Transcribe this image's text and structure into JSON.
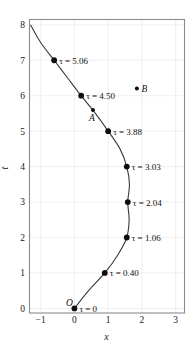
{
  "chart_data": {
    "type": "line",
    "title": "",
    "xlabel": "x",
    "ylabel": "t",
    "xlim": [
      -1.33,
      3.26
    ],
    "ylim": [
      -0.13,
      8.15
    ],
    "xticks": [
      -1,
      0,
      1,
      2,
      3
    ],
    "xticklabels": [
      "−1",
      "0",
      "1",
      "2",
      "3"
    ],
    "yticks": [
      0,
      1,
      2,
      3,
      4,
      5,
      6,
      7,
      8
    ],
    "yticklabels": [
      "0",
      "1",
      "2",
      "3",
      "4",
      "5",
      "6",
      "7",
      "8"
    ],
    "grid": true,
    "legend": "none",
    "series": [
      {
        "name": "trajectory",
        "x": [
          0.0,
          0.42,
          0.9,
          1.28,
          1.55,
          1.62,
          1.58,
          1.63,
          1.55,
          1.35,
          1.0,
          0.62,
          0.2,
          -0.2,
          -0.6,
          -1.0,
          -1.3
        ],
        "t": [
          0.0,
          0.5,
          1.0,
          1.5,
          2.0,
          2.5,
          3.0,
          3.5,
          4.0,
          4.5,
          5.0,
          5.5,
          6.0,
          6.5,
          7.0,
          7.5,
          8.0
        ]
      }
    ],
    "marked_points": [
      {
        "name": "origin",
        "x": 0.0,
        "t": 0,
        "label": "τ = 0",
        "label_dx": 5,
        "label_dy": 3.5
      },
      {
        "name": "tau-0.40",
        "x": 0.9,
        "t": 1,
        "label": "τ = 0.40",
        "label_dx": 5,
        "label_dy": 3.5
      },
      {
        "name": "tau-1.06",
        "x": 1.55,
        "t": 2,
        "label": "τ = 1.06",
        "label_dx": 5,
        "label_dy": 3.5
      },
      {
        "name": "tau-2.04",
        "x": 1.58,
        "t": 3,
        "label": "τ = 2.04",
        "label_dx": 5,
        "label_dy": 3.5
      },
      {
        "name": "tau-3.03",
        "x": 1.55,
        "t": 4,
        "label": "τ = 3.03",
        "label_dx": 5,
        "label_dy": 3.5
      },
      {
        "name": "tau-3.88",
        "x": 1.0,
        "t": 5,
        "label": "τ = 3.88",
        "label_dx": 5,
        "label_dy": 3.5
      },
      {
        "name": "tau-4.50",
        "x": 0.2,
        "t": 6,
        "label": "τ = 4.50",
        "label_dx": 5,
        "label_dy": 3.5
      },
      {
        "name": "tau-5.06",
        "x": -0.6,
        "t": 7,
        "label": "τ = 5.06",
        "label_dx": 5,
        "label_dy": 3.5
      }
    ],
    "annotated_points": [
      {
        "name": "point-a",
        "x": 0.55,
        "t": 5.6,
        "label": "A",
        "label_dx": -4,
        "label_dy": 11,
        "dot_size": 2.0
      },
      {
        "name": "point-b",
        "x": 1.85,
        "t": 6.2,
        "label": "B",
        "label_dx": 4.5,
        "label_dy": 3.5,
        "dot_size": 2.0
      }
    ],
    "origin_marker": {
      "name": "origin-letter",
      "label": "O",
      "x": 0.0,
      "t": 0,
      "label_dx": -8.5,
      "label_dy": -2
    },
    "annotations": [
      "O",
      "A",
      "B"
    ]
  },
  "colors": {
    "curve": "#3a3a3a",
    "dot": "#0d0d0d",
    "frame": "#8a8a90",
    "grid": "#e9e9ec",
    "text": "#1a1a1a",
    "background": "#ffffff"
  }
}
